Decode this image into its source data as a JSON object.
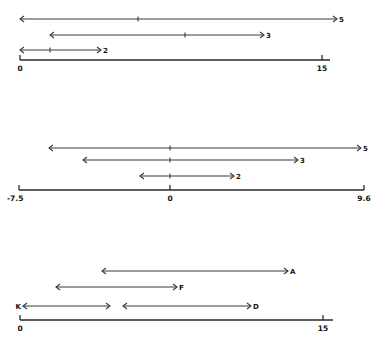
{
  "panels": [
    {
      "name": "top",
      "axis": {
        "y": 60,
        "x1": 20,
        "x2": 330,
        "ticks": [
          {
            "x": 20,
            "label": "0"
          },
          {
            "x": 322,
            "label": "15"
          }
        ]
      },
      "intervals": [
        {
          "x1": 20,
          "x2": 337,
          "y": 19,
          "mid": 138,
          "label": "5",
          "label_side": "right"
        },
        {
          "x1": 50,
          "x2": 264,
          "y": 35,
          "mid": 185,
          "label": "3",
          "label_side": "right"
        },
        {
          "x1": 20,
          "x2": 101,
          "y": 50,
          "mid": 50,
          "label": "2",
          "label_side": "right"
        }
      ]
    },
    {
      "name": "middle",
      "axis": {
        "y": 190,
        "x1": 19,
        "x2": 364,
        "ticks": [
          {
            "x": 19,
            "label": "-7.5"
          },
          {
            "x": 170,
            "label": "0"
          },
          {
            "x": 364,
            "label": "9.6"
          }
        ]
      },
      "intervals": [
        {
          "x1": 49,
          "x2": 361,
          "y": 148,
          "mid": 170,
          "label": "5",
          "label_side": "right"
        },
        {
          "x1": 83,
          "x2": 298,
          "y": 160,
          "mid": 170,
          "label": "3",
          "label_side": "right"
        },
        {
          "x1": 140,
          "x2": 234,
          "y": 176,
          "mid": 170,
          "label": "2",
          "label_side": "right"
        }
      ]
    },
    {
      "name": "bottom",
      "axis": {
        "y": 320,
        "x1": 20,
        "x2": 333,
        "ticks": [
          {
            "x": 20,
            "label": "0"
          },
          {
            "x": 323,
            "label": "15"
          }
        ]
      },
      "intervals": [
        {
          "x1": 102,
          "x2": 288,
          "y": 271,
          "mid": null,
          "label": "A",
          "label_side": "right"
        },
        {
          "x1": 56,
          "x2": 177,
          "y": 287,
          "mid": null,
          "label": "F",
          "label_side": "right"
        },
        {
          "x1": 23,
          "x2": 110,
          "y": 306,
          "mid": null,
          "label": "K",
          "label_side": "left"
        },
        {
          "x1": 123,
          "x2": 251,
          "y": 306,
          "mid": null,
          "label": "D",
          "label_side": "right"
        }
      ]
    }
  ]
}
